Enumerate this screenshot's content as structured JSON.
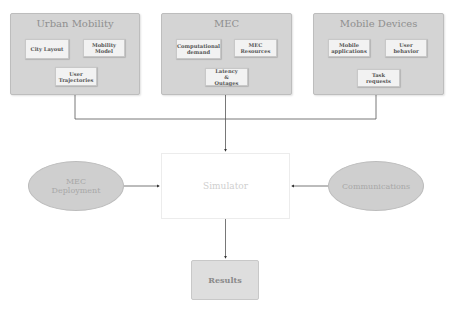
{
  "diagram": {
    "groups": [
      {
        "title": "Urban Mobility",
        "items": [
          "City Layout",
          "Mobility Model",
          "User Trajectories"
        ]
      },
      {
        "title": "MEC",
        "items": [
          "Computational demand",
          "MEC Resources",
          "Latency & Outages"
        ]
      },
      {
        "title": "Mobile Devices",
        "items": [
          "Mobile applications",
          "User behavior",
          "Task requests"
        ]
      }
    ],
    "simulator": "Simulator",
    "inputs": {
      "left": "MEC Deployment",
      "right": "Communications"
    },
    "output": "Results",
    "colors": {
      "group_fill": "#d4d4d4",
      "sub_fill": "#f2f2f2",
      "ellipse_fill": "#cfcfcf",
      "line": "#555555"
    }
  }
}
